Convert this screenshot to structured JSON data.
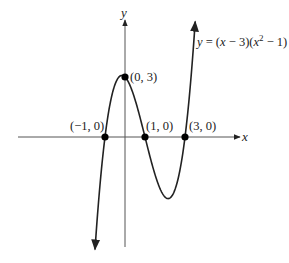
{
  "chart_data": {
    "type": "line",
    "title": "",
    "xlabel": "x",
    "ylabel": "y",
    "function": "y = (x - 3)(x^2 - 1)",
    "equation_label": {
      "prefix": "y = (",
      "x1": "x",
      "mid": " − 3)(",
      "x2": "x",
      "sup": "2",
      "suffix": " − 1)"
    },
    "xlim": [
      -5.35,
      5.75
    ],
    "ylim": [
      -6.3,
      6.0
    ],
    "grid": false,
    "curve_domain": [
      -1.5,
      3.51
    ],
    "points": [
      {
        "x": -1,
        "y": 0,
        "label": "(−1, 0)"
      },
      {
        "x": 0,
        "y": 3,
        "label": "(0, 3)"
      },
      {
        "x": 1,
        "y": 0,
        "label": "(1, 0)"
      },
      {
        "x": 3,
        "y": 0,
        "label": "(3, 0)"
      }
    ]
  }
}
